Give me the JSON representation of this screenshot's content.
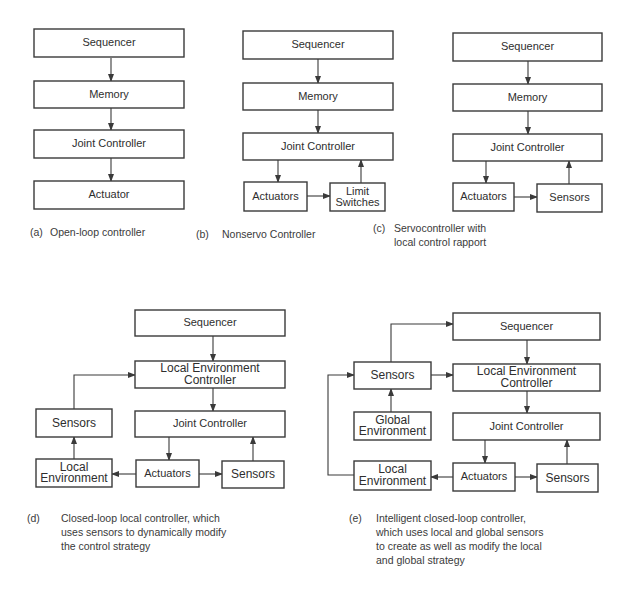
{
  "colors": {
    "stroke": "#3a3a3a",
    "text": "#2e2e2e",
    "background": "#ffffff"
  },
  "diagrams": [
    {
      "id": "a",
      "boxes": [
        {
          "id": "seq",
          "lines": [
            "Sequencer"
          ],
          "x": 34,
          "y": 29,
          "w": 150,
          "h": 28,
          "fs": 11
        },
        {
          "id": "mem",
          "lines": [
            "Memory"
          ],
          "x": 34,
          "y": 81,
          "w": 150,
          "h": 27,
          "fs": 11
        },
        {
          "id": "jc",
          "lines": [
            "Joint  Controller"
          ],
          "x": 34,
          "y": 130,
          "w": 150,
          "h": 28,
          "fs": 11
        },
        {
          "id": "act",
          "lines": [
            "Actuator"
          ],
          "x": 34,
          "y": 181,
          "w": 150,
          "h": 28,
          "fs": 11
        }
      ],
      "arrows": [
        [
          [
            111,
            58
          ],
          [
            111,
            81
          ]
        ],
        [
          [
            111,
            108
          ],
          [
            111,
            130
          ]
        ],
        [
          [
            111,
            158
          ],
          [
            111,
            181
          ]
        ]
      ],
      "caption": {
        "label": "(a)",
        "lines": [
          "Open-loop controller"
        ],
        "x": 30,
        "tx": 50,
        "y": 232
      }
    },
    {
      "id": "b",
      "boxes": [
        {
          "id": "seq",
          "lines": [
            "Sequencer"
          ],
          "x": 243,
          "y": 31,
          "w": 150,
          "h": 28,
          "fs": 11
        },
        {
          "id": "mem",
          "lines": [
            "Memory"
          ],
          "x": 243,
          "y": 83,
          "w": 150,
          "h": 27,
          "fs": 11
        },
        {
          "id": "jc",
          "lines": [
            "Joint  Controller"
          ],
          "x": 243,
          "y": 133,
          "w": 150,
          "h": 27,
          "fs": 11
        },
        {
          "id": "act",
          "lines": [
            "Actuators"
          ],
          "x": 244,
          "y": 182,
          "w": 63,
          "h": 29,
          "fs": 11
        },
        {
          "id": "lim",
          "lines": [
            "Limit",
            "Switches"
          ],
          "x": 330,
          "y": 183,
          "w": 55,
          "h": 28,
          "fs": 11
        }
      ],
      "arrows": [
        [
          [
            318,
            59
          ],
          [
            318,
            83
          ]
        ],
        [
          [
            318,
            110
          ],
          [
            318,
            133
          ]
        ],
        [
          [
            278,
            160
          ],
          [
            278,
            182
          ]
        ],
        [
          [
            307,
            196
          ],
          [
            330,
            196
          ]
        ],
        [
          [
            361,
            183
          ],
          [
            361,
            160
          ]
        ]
      ],
      "caption": {
        "label": "(b)",
        "lines": [
          "Nonservo Controller"
        ],
        "x": 196,
        "tx": 222,
        "y": 234
      }
    },
    {
      "id": "c",
      "boxes": [
        {
          "id": "seq",
          "lines": [
            "Sequencer"
          ],
          "x": 453,
          "y": 33,
          "w": 149,
          "h": 28,
          "fs": 11
        },
        {
          "id": "mem",
          "lines": [
            "Memory"
          ],
          "x": 453,
          "y": 84,
          "w": 149,
          "h": 27,
          "fs": 11
        },
        {
          "id": "jc",
          "lines": [
            "Joint  Controller"
          ],
          "x": 453,
          "y": 134,
          "w": 149,
          "h": 27,
          "fs": 11
        },
        {
          "id": "act",
          "lines": [
            "Actuators"
          ],
          "x": 453,
          "y": 183,
          "w": 61,
          "h": 28,
          "fs": 11
        },
        {
          "id": "sen",
          "lines": [
            "Sensors"
          ],
          "x": 537,
          "y": 184,
          "w": 65,
          "h": 28,
          "fs": 11
        }
      ],
      "arrows": [
        [
          [
            528,
            61
          ],
          [
            528,
            84
          ]
        ],
        [
          [
            528,
            111
          ],
          [
            528,
            134
          ]
        ],
        [
          [
            486,
            161
          ],
          [
            486,
            183
          ]
        ],
        [
          [
            514,
            197
          ],
          [
            537,
            197
          ]
        ],
        [
          [
            569,
            184
          ],
          [
            569,
            161
          ]
        ]
      ],
      "caption": {
        "label": "(c)",
        "lines": [
          "Servocontroller  with",
          "local control rapport"
        ],
        "x": 373,
        "tx": 394,
        "y": 228
      }
    },
    {
      "id": "d",
      "boxes": [
        {
          "id": "seq",
          "lines": [
            "Sequencer"
          ],
          "x": 135,
          "y": 310,
          "w": 150,
          "h": 26,
          "fs": 11
        },
        {
          "id": "lec",
          "lines": [
            "Local   Environment",
            "Controller"
          ],
          "x": 135,
          "y": 361,
          "w": 150,
          "h": 27,
          "fs": 12
        },
        {
          "id": "jc",
          "lines": [
            "Joint  Controller"
          ],
          "x": 135,
          "y": 411,
          "w": 150,
          "h": 26,
          "fs": 11
        },
        {
          "id": "sen-l",
          "lines": [
            "Sensors"
          ],
          "x": 36,
          "y": 409,
          "w": 76,
          "h": 28,
          "fs": 12
        },
        {
          "id": "lenv",
          "lines": [
            "Local",
            "Environment"
          ],
          "x": 36,
          "y": 459,
          "w": 76,
          "h": 28,
          "fs": 12
        },
        {
          "id": "act",
          "lines": [
            "Actuators"
          ],
          "x": 136,
          "y": 460,
          "w": 63,
          "h": 27,
          "fs": 11
        },
        {
          "id": "sen-r",
          "lines": [
            "Sensors"
          ],
          "x": 222,
          "y": 461,
          "w": 62,
          "h": 27,
          "fs": 12
        }
      ],
      "arrows": [
        [
          [
            213,
            336
          ],
          [
            213,
            361
          ]
        ],
        [
          [
            213,
            388
          ],
          [
            213,
            411
          ]
        ],
        [
          [
            74,
            409
          ],
          [
            74,
            375
          ],
          [
            135,
            375
          ]
        ],
        [
          [
            74,
            459
          ],
          [
            74,
            437
          ]
        ],
        [
          [
            169,
            437
          ],
          [
            169,
            460
          ]
        ],
        [
          [
            253,
            461
          ],
          [
            253,
            437
          ]
        ],
        [
          [
            136,
            474
          ],
          [
            112,
            474
          ]
        ],
        [
          [
            199,
            474
          ],
          [
            222,
            474
          ]
        ]
      ],
      "caption": {
        "label": "(d)",
        "lines": [
          "Closed-loop local controller, which",
          "uses sensors to dynamically modify",
          "the control strategy"
        ],
        "x": 27,
        "tx": 61,
        "y": 518
      }
    },
    {
      "id": "e",
      "boxes": [
        {
          "id": "seq",
          "lines": [
            "Sequencer"
          ],
          "x": 453,
          "y": 313,
          "w": 147,
          "h": 27,
          "fs": 11
        },
        {
          "id": "sen-l",
          "lines": [
            "Sensors"
          ],
          "x": 354,
          "y": 362,
          "w": 77,
          "h": 27,
          "fs": 12
        },
        {
          "id": "lec",
          "lines": [
            "Local   Environment",
            "Controller"
          ],
          "x": 453,
          "y": 364,
          "w": 147,
          "h": 27,
          "fs": 12
        },
        {
          "id": "genv",
          "lines": [
            "Global",
            "Environment"
          ],
          "x": 354,
          "y": 412,
          "w": 77,
          "h": 28,
          "fs": 12
        },
        {
          "id": "jc",
          "lines": [
            "Joint  Controller"
          ],
          "x": 453,
          "y": 413,
          "w": 147,
          "h": 27,
          "fs": 11
        },
        {
          "id": "lenv",
          "lines": [
            "Local",
            "Environment"
          ],
          "x": 354,
          "y": 461,
          "w": 77,
          "h": 29,
          "fs": 12
        },
        {
          "id": "act",
          "lines": [
            "Actuators"
          ],
          "x": 453,
          "y": 463,
          "w": 62,
          "h": 28,
          "fs": 11
        },
        {
          "id": "sen-r",
          "lines": [
            "Sensors"
          ],
          "x": 537,
          "y": 464,
          "w": 61,
          "h": 28,
          "fs": 12
        }
      ],
      "arrows": [
        [
          [
            391,
            362
          ],
          [
            391,
            324
          ],
          [
            453,
            324
          ]
        ],
        [
          [
            431,
            375
          ],
          [
            453,
            375
          ]
        ],
        [
          [
            527,
            340
          ],
          [
            527,
            364
          ]
        ],
        [
          [
            527,
            391
          ],
          [
            527,
            413
          ]
        ],
        [
          [
            391,
            412
          ],
          [
            391,
            389
          ]
        ],
        [
          [
            354,
            475
          ],
          [
            328,
            475
          ],
          [
            328,
            375
          ],
          [
            354,
            375
          ]
        ],
        [
          [
            485,
            440
          ],
          [
            485,
            463
          ]
        ],
        [
          [
            567,
            464
          ],
          [
            567,
            440
          ]
        ],
        [
          [
            453,
            477
          ],
          [
            431,
            477
          ]
        ],
        [
          [
            515,
            477
          ],
          [
            537,
            477
          ]
        ]
      ],
      "caption": {
        "label": "(e)",
        "lines": [
          "Intelligent closed-loop controller,",
          "which uses local and global sensors",
          "to create as well as modify the local",
          "and global strategy"
        ],
        "x": 349,
        "tx": 376,
        "y": 518
      }
    }
  ]
}
